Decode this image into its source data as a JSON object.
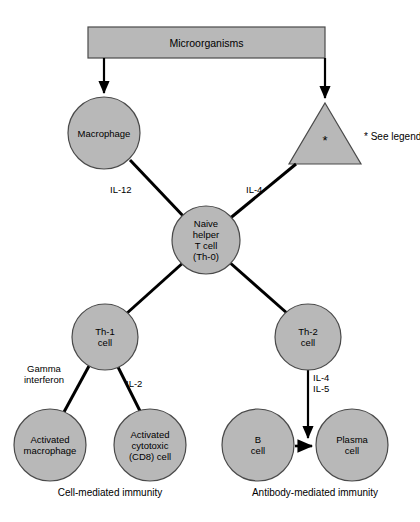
{
  "diagram": {
    "title": "Microorganisms",
    "source_box": {
      "label": "Microorganisms"
    },
    "style": {
      "shape_fill": "#b8b8b8",
      "shape_stroke": "#4a4a4a",
      "line_color": "#000000",
      "text_color": "#000000",
      "background": "#ffffff"
    },
    "nodes": [
      {
        "id": "macrophage",
        "label": "Macrophage",
        "shape": "circle",
        "cx": 104,
        "cy": 133,
        "r": 36
      },
      {
        "id": "antigen-triangle",
        "label": "*",
        "shape": "triangle",
        "cx": 325,
        "cy": 135
      },
      {
        "id": "naive-t",
        "label": "Naive\nhelper\nT cell\n(Th-0)",
        "shape": "circle",
        "cx": 206,
        "cy": 240,
        "r": 34
      },
      {
        "id": "th1",
        "label": "Th-1\ncell",
        "shape": "circle",
        "cx": 105,
        "cy": 337,
        "r": 33
      },
      {
        "id": "th2",
        "label": "Th-2\ncell",
        "shape": "circle",
        "cx": 308,
        "cy": 337,
        "r": 33
      },
      {
        "id": "activated-macrophage",
        "label": "Activated\nmacrophage",
        "shape": "circle",
        "cx": 50,
        "cy": 445,
        "r": 36
      },
      {
        "id": "activated-cytotoxic",
        "label": "Activated\ncytotoxic\n(CD8) cell",
        "shape": "circle",
        "cx": 150,
        "cy": 445,
        "r": 36
      },
      {
        "id": "b-cell",
        "label": "B\ncell",
        "shape": "circle",
        "cx": 258,
        "cy": 445,
        "r": 36
      },
      {
        "id": "plasma-cell",
        "label": "Plasma\ncell",
        "shape": "circle",
        "cx": 352,
        "cy": 445,
        "r": 36
      }
    ],
    "edge_labels": [
      {
        "id": "il-12",
        "text": "IL-12",
        "x": 110,
        "y": 184
      },
      {
        "id": "il-4-top",
        "text": "IL-4",
        "x": 246,
        "y": 184
      },
      {
        "id": "gamma-interferon",
        "text": "Gamma\ninterferon",
        "x": 12,
        "y": 363
      },
      {
        "id": "il-2",
        "text": "IL-2",
        "x": 126,
        "y": 378
      },
      {
        "id": "il-4-il-5",
        "text": "IL-4\nIL-5",
        "x": 313,
        "y": 372
      }
    ],
    "captions": [
      {
        "id": "cell-mediated",
        "text": "Cell-mediated immunity",
        "x": 20,
        "y": 487,
        "width": 180
      },
      {
        "id": "antibody-mediated",
        "text": "Antibody-mediated immunity",
        "x": 215,
        "y": 487,
        "width": 200
      }
    ],
    "legend": {
      "marker": "*",
      "text": "* See legend",
      "x": 364,
      "y": 131
    }
  }
}
